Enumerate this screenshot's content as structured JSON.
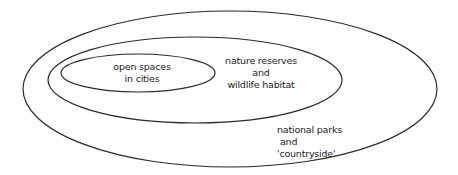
{
  "diagram": {
    "type": "nested-sets",
    "stroke_color": "#2a2a2a",
    "sets": [
      {
        "id": "outer",
        "lines": [
          "national parks",
          "and",
          "'countryside'"
        ],
        "ellipse": {
          "cx": 230,
          "cy": 89,
          "rx": 207,
          "ry": 78
        }
      },
      {
        "id": "middle",
        "lines": [
          "nature reserves",
          "and",
          "wildlife habitat"
        ],
        "ellipse": {
          "cx": 195,
          "cy": 80,
          "rx": 147,
          "ry": 43
        }
      },
      {
        "id": "inner",
        "lines": [
          "open spaces",
          "in cities"
        ],
        "ellipse": {
          "cx": 138,
          "cy": 73,
          "rx": 77,
          "ry": 19
        }
      }
    ]
  }
}
